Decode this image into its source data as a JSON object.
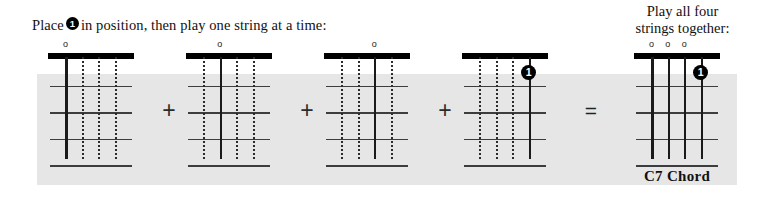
{
  "instruction": {
    "text_before_badge": "Place",
    "badge_number": "1",
    "text_after_badge": "in position, then play one string at a time:"
  },
  "final_heading": {
    "line1": "Play all four",
    "line2": "strings together:"
  },
  "chord_label": "C7 Chord",
  "operators": {
    "plus": "+",
    "equals": "="
  },
  "open_marker_glyph": "o",
  "diagrams": [
    {
      "name": "string-1-open",
      "strings": [
        "active",
        "muted",
        "muted",
        "muted"
      ],
      "open_markers": [
        true,
        false,
        false,
        false
      ],
      "finger_markers": []
    },
    {
      "name": "string-2-open",
      "strings": [
        "muted",
        "active",
        "muted",
        "muted"
      ],
      "open_markers": [
        false,
        true,
        false,
        false
      ],
      "finger_markers": []
    },
    {
      "name": "string-3-open",
      "strings": [
        "muted",
        "muted",
        "active",
        "muted"
      ],
      "open_markers": [
        false,
        false,
        true,
        false
      ],
      "finger_markers": []
    },
    {
      "name": "string-4-fretted",
      "strings": [
        "muted",
        "muted",
        "muted",
        "active"
      ],
      "open_markers": [
        false,
        false,
        false,
        false
      ],
      "finger_markers": [
        {
          "string": 4,
          "fret": 1,
          "label": "1"
        }
      ]
    },
    {
      "name": "c7-full-chord",
      "strings": [
        "active",
        "active",
        "active",
        "active"
      ],
      "open_markers": [
        true,
        true,
        true,
        false
      ],
      "finger_markers": [
        {
          "string": 4,
          "fret": 1,
          "label": "1"
        }
      ]
    }
  ],
  "colors": {
    "band_background": "#e6e6e6",
    "page_background": "#ffffff",
    "ink": "#111111",
    "grid": "#3d3d3d",
    "marker_fill": "#000000",
    "marker_text": "#ffffff"
  }
}
